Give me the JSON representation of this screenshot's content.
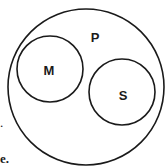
{
  "diagram": {
    "type": "venn",
    "stroke_color": "#1a1a1a",
    "outer_set": {
      "label": "P",
      "cx": 86,
      "cy": 87,
      "r": 78,
      "label_x": 95,
      "label_y": 42
    },
    "inner_sets": [
      {
        "label": "M",
        "cx": 50,
        "cy": 69,
        "r": 33,
        "label_x": 49,
        "label_y": 75
      },
      {
        "label": "S",
        "cx": 122,
        "cy": 92,
        "r": 33,
        "label_x": 123,
        "label_y": 100
      }
    ],
    "relationships": [
      "M subset of P",
      "S subset of P",
      "M and S disjoint"
    ]
  },
  "text_fragments": [
    {
      "text": ".",
      "x": 0,
      "y": 116
    },
    {
      "text": "e.",
      "x": 0,
      "y": 152
    }
  ]
}
